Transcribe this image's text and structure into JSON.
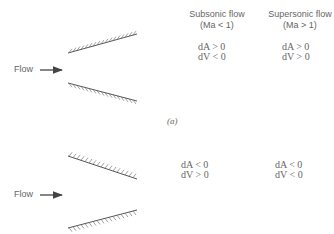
{
  "headers": {
    "subsonic": {
      "title": "Subsonic flow",
      "condition": "(Ma < 1)"
    },
    "supersonic": {
      "title": "Supersonic flow",
      "condition": "(Ma > 1)"
    }
  },
  "panel_a": {
    "caption": "(a)",
    "geometry": "diverging duct",
    "flow_label": "Flow",
    "subsonic": {
      "dA": "dA > 0",
      "dV": "dV < 0"
    },
    "supersonic": {
      "dA": "dA > 0",
      "dV": "dV > 0"
    }
  },
  "panel_b": {
    "geometry": "converging duct",
    "flow_label": "Flow",
    "subsonic": {
      "dA": "dA < 0",
      "dV": "dV > 0"
    },
    "supersonic": {
      "dA": "dA < 0",
      "dV": "dV < 0"
    }
  },
  "icons": {
    "flow_arrow": "arrow-right-icon",
    "wall": "hatched-wall-icon"
  },
  "colors": {
    "line": "#555555",
    "text": "#666666",
    "background": "#ffffff"
  }
}
